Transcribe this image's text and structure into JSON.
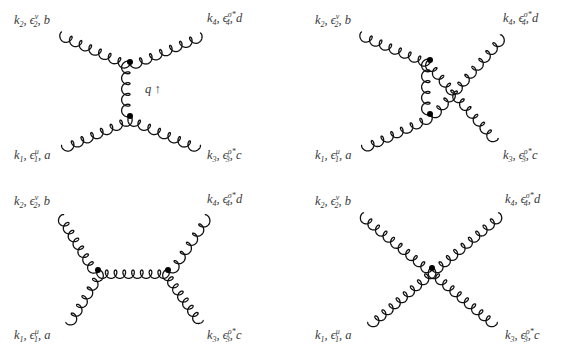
{
  "figure": {
    "width": 564,
    "height": 349,
    "line_color": "#111111",
    "label_color": "#3a3a3a",
    "vertex_color": "#000000"
  },
  "particles": {
    "p1": {
      "k": "k",
      "k_sub": "1",
      "eps_sub": "1",
      "eps_sup": "μ",
      "color": "a"
    },
    "p2": {
      "k": "k",
      "k_sub": "2",
      "eps_sub": "2",
      "eps_sup": "ν",
      "color": "b"
    },
    "p3": {
      "k": "k",
      "k_sub": "3",
      "eps_sub": "3",
      "eps_sup": "ρ*",
      "color": "c"
    },
    "p4": {
      "k": "k",
      "k_sub": "4",
      "eps_sub": "4",
      "eps_sup": "σ*",
      "color": "d"
    }
  },
  "diagrams": [
    {
      "id": "s-channel-vertical",
      "labels": [
        {
          "particle": "p2",
          "x": 14,
          "y": 10
        },
        {
          "particle": "p4",
          "x": 207,
          "y": 8
        },
        {
          "particle": "p1",
          "x": 14,
          "y": 145
        },
        {
          "particle": "p3",
          "x": 207,
          "y": 145
        }
      ],
      "annotation": {
        "text": "q ↑",
        "x": 145,
        "y": 82
      },
      "vertices": [
        [
          130,
          62
        ],
        [
          130,
          116
        ]
      ],
      "gluons": [
        {
          "from": [
            62,
            32
          ],
          "to": [
            130,
            62
          ],
          "loops": 7
        },
        {
          "from": [
            130,
            62
          ],
          "to": [
            200,
            33
          ],
          "loops": 7
        },
        {
          "from": [
            130,
            62
          ],
          "to": [
            130,
            116
          ],
          "loops": 5
        },
        {
          "from": [
            62,
            145
          ],
          "to": [
            130,
            116
          ],
          "loops": 7
        },
        {
          "from": [
            130,
            116
          ],
          "to": [
            200,
            145
          ],
          "loops": 7
        }
      ]
    },
    {
      "id": "crossed",
      "labels": [
        {
          "particle": "p2",
          "x": 315,
          "y": 10
        },
        {
          "particle": "p4",
          "x": 503,
          "y": 8
        },
        {
          "particle": "p1",
          "x": 315,
          "y": 145
        },
        {
          "particle": "p3",
          "x": 503,
          "y": 145
        }
      ],
      "vertices": [
        [
          430,
          60
        ],
        [
          430,
          114
        ]
      ],
      "gluons": [
        {
          "from": [
            362,
            32
          ],
          "to": [
            430,
            60
          ],
          "loops": 7
        },
        {
          "from": [
            362,
            145
          ],
          "to": [
            430,
            114
          ],
          "loops": 7
        },
        {
          "from": [
            430,
            60
          ],
          "to": [
            430,
            114
          ],
          "loops": 5
        },
        {
          "from": [
            430,
            60
          ],
          "to": [
            498,
            138
          ],
          "loops": 10
        },
        {
          "from": [
            430,
            114
          ],
          "to": [
            500,
            35
          ],
          "loops": 10
        }
      ]
    },
    {
      "id": "horizontal-exchange",
      "labels": [
        {
          "particle": "p2",
          "x": 14,
          "y": 191
        },
        {
          "particle": "p4",
          "x": 207,
          "y": 189
        },
        {
          "particle": "p1",
          "x": 14,
          "y": 325
        },
        {
          "particle": "p3",
          "x": 207,
          "y": 325
        }
      ],
      "vertices": [
        [
          98,
          270
        ],
        [
          168,
          270
        ]
      ],
      "gluons": [
        {
          "from": [
            64,
            215
          ],
          "to": [
            98,
            270
          ],
          "loops": 7
        },
        {
          "from": [
            66,
            322
          ],
          "to": [
            98,
            270
          ],
          "loops": 6
        },
        {
          "from": [
            98,
            270
          ],
          "to": [
            168,
            270
          ],
          "loops": 8
        },
        {
          "from": [
            168,
            270
          ],
          "to": [
            205,
            215
          ],
          "loops": 6
        },
        {
          "from": [
            168,
            270
          ],
          "to": [
            203,
            320
          ],
          "loops": 7
        }
      ]
    },
    {
      "id": "four-gluon-contact",
      "labels": [
        {
          "particle": "p2",
          "x": 315,
          "y": 191
        },
        {
          "particle": "p4",
          "x": 505,
          "y": 189
        },
        {
          "particle": "p1",
          "x": 315,
          "y": 325
        },
        {
          "particle": "p3",
          "x": 505,
          "y": 325
        }
      ],
      "vertices": [
        [
          432,
          268
        ]
      ],
      "gluons": [
        {
          "from": [
            364,
            213
          ],
          "to": [
            432,
            268
          ],
          "loops": 9
        },
        {
          "from": [
            432,
            268
          ],
          "to": [
            498,
            213
          ],
          "loops": 9
        },
        {
          "from": [
            368,
            322
          ],
          "to": [
            432,
            268
          ],
          "loops": 9
        },
        {
          "from": [
            432,
            268
          ],
          "to": [
            497,
            322
          ],
          "loops": 9
        }
      ]
    }
  ]
}
